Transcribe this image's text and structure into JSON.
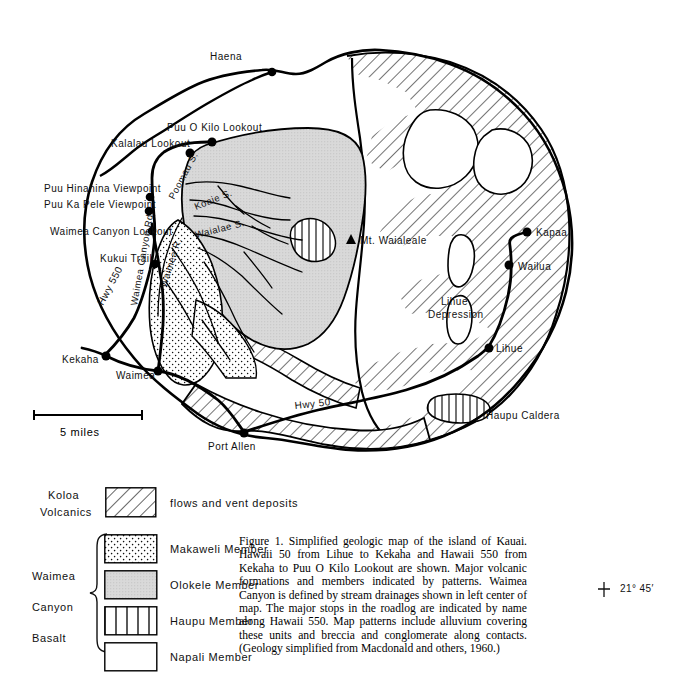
{
  "figure": {
    "caption": "Figure 1. Simplified geologic map of the island of Kauai. Hawaii 50 from Lihue to Kekaha and Hawaii 550 from Kekaha to Puu O Kilo Lookout are shown. Major volcanic formations and members indicated by patterns. Waimea Canyon is defined by stream drainages shown in left center of map. The major stops in the roadlog are indicated by name along Hawaii 550. Map patterns include alluvium covering these units and breccia and conglomerate along contacts. (Geology simplified from Macdonald and others, 1960.)"
  },
  "coordinates": [
    {
      "id": "lon-159-45",
      "label": "159° 45′",
      "x": 44,
      "y": 22,
      "tick": "top"
    },
    {
      "id": "lon-159-30",
      "label": "159° 30′",
      "x": 322,
      "y": 22,
      "tick": "top"
    },
    {
      "id": "lon-159-15",
      "label": "159° 15′",
      "x": 600,
      "y": 22,
      "tick": "corner"
    },
    {
      "id": "lat-22-15",
      "label": "22° 15′",
      "x": 622,
      "y": 44,
      "tick": "corner"
    },
    {
      "id": "lat-22",
      "label": "22°",
      "x": 620,
      "y": 313,
      "tick": "right"
    },
    {
      "id": "lat-21-45",
      "label": "21° 45′",
      "x": 620,
      "y": 583,
      "tick": "right"
    }
  ],
  "scale": {
    "label": "5 miles",
    "length_miles": 5
  },
  "places": [
    {
      "name": "Haena",
      "lx": 243,
      "ly": 57,
      "px": 272,
      "py": 72,
      "anchor": "end"
    },
    {
      "name": "Puu O Kilo Lookout",
      "lx": 168,
      "ly": 131,
      "px": 215,
      "py": 143,
      "anchor": "start"
    },
    {
      "name": "Kalalau Lookout",
      "lx": 112,
      "ly": 147,
      "px": 198,
      "py": 157,
      "anchor": "start"
    },
    {
      "name": "Puu Hinahina Viewpoint",
      "lx": 44,
      "ly": 192,
      "px": 149,
      "py": 199,
      "anchor": "start"
    },
    {
      "name": "Puu Ka Pele Viewpoint",
      "lx": 44,
      "ly": 208,
      "px": 147,
      "py": 214,
      "anchor": "start"
    },
    {
      "name": "Waimea Canyon Lookout",
      "lx": 50,
      "ly": 235,
      "px": 153,
      "py": 227,
      "anchor": "start"
    },
    {
      "name": "Kukui Trail",
      "lx": 100,
      "ly": 262,
      "px": 165,
      "py": 264,
      "anchor": "start"
    },
    {
      "name": "Kekaha",
      "lx": 64,
      "ly": 363,
      "px": 105,
      "py": 355,
      "anchor": "start"
    },
    {
      "name": "Waimea",
      "lx": 117,
      "ly": 378,
      "px": 158,
      "py": 371,
      "anchor": "start"
    },
    {
      "name": "Port Allen",
      "lx": 208,
      "ly": 450,
      "px": 244,
      "py": 432,
      "anchor": "start"
    },
    {
      "name": "Lihue",
      "lx": 512,
      "ly": 352,
      "px": 487,
      "py": 348,
      "anchor": "start"
    },
    {
      "name": "Wailua",
      "lx": 522,
      "ly": 272,
      "px": 509,
      "py": 265,
      "anchor": "start"
    },
    {
      "name": "Kapaa",
      "lx": 540,
      "ly": 235,
      "px": 527,
      "py": 232,
      "anchor": "start"
    }
  ],
  "map_labels": [
    {
      "id": "mt-waialeale",
      "text": "Mt. Waialeale",
      "x": 354,
      "y": 240,
      "rot": 0,
      "size": 10
    },
    {
      "id": "lihue-depression-1",
      "text": "Lihue",
      "x": 441,
      "y": 305,
      "rot": 0,
      "size": 10
    },
    {
      "id": "lihue-depression-2",
      "text": "Depression",
      "x": 431,
      "y": 318,
      "rot": 0,
      "size": 10
    },
    {
      "id": "haupu-caldera",
      "text": "Haupu Caldera",
      "x": 482,
      "y": 420,
      "rot": 0,
      "size": 10
    },
    {
      "id": "hwy-50",
      "text": "Hwy 50",
      "x": 295,
      "y": 409,
      "rot": -6,
      "size": 10
    },
    {
      "id": "hwy-550",
      "text": "Hwy 550",
      "x": 103,
      "y": 302,
      "rot": -62,
      "size": 10
    },
    {
      "id": "waimea-canyon-rd",
      "text": "Waimea Canyon Rd.",
      "x": 140,
      "y": 300,
      "rot": -80,
      "size": 9.5
    },
    {
      "id": "waimea-river",
      "text": "Waimea  R.",
      "x": 166,
      "y": 282,
      "rot": -72,
      "size": 9.5
    },
    {
      "id": "poomau-stream",
      "text": "Poomau  S.",
      "x": 176,
      "y": 193,
      "rot": -62,
      "size": 9.5
    },
    {
      "id": "koaie-stream",
      "text": "Koaie  S.",
      "x": 200,
      "y": 206,
      "rot": -22,
      "size": 9.5
    },
    {
      "id": "waialae-stream",
      "text": "Waialae  S.",
      "x": 200,
      "y": 233,
      "rot": -14,
      "size": 9.5
    }
  ],
  "legend": {
    "koloa": {
      "group": [
        "Koloa",
        "Volcanics"
      ],
      "items": [
        {
          "id": "koloa-flows",
          "label": "flows and vent deposits",
          "pattern": "diagonal-hatch"
        }
      ]
    },
    "waimea": {
      "group": [
        "Waimea",
        "Canyon",
        "Basalt"
      ],
      "items": [
        {
          "id": "makaweli-member",
          "label": "Makaweli Member",
          "pattern": "dots"
        },
        {
          "id": "olokele-member",
          "label": "Olokele Member",
          "pattern": "solid-gray"
        },
        {
          "id": "haupu-member",
          "label": "Haupu Member",
          "pattern": "vertical-lines"
        },
        {
          "id": "napali-member",
          "label": "Napali Member",
          "pattern": "blank"
        }
      ]
    }
  },
  "colors": {
    "ink": "#000000",
    "olokele_gray": "#d9d9d9",
    "paper": "#ffffff"
  }
}
